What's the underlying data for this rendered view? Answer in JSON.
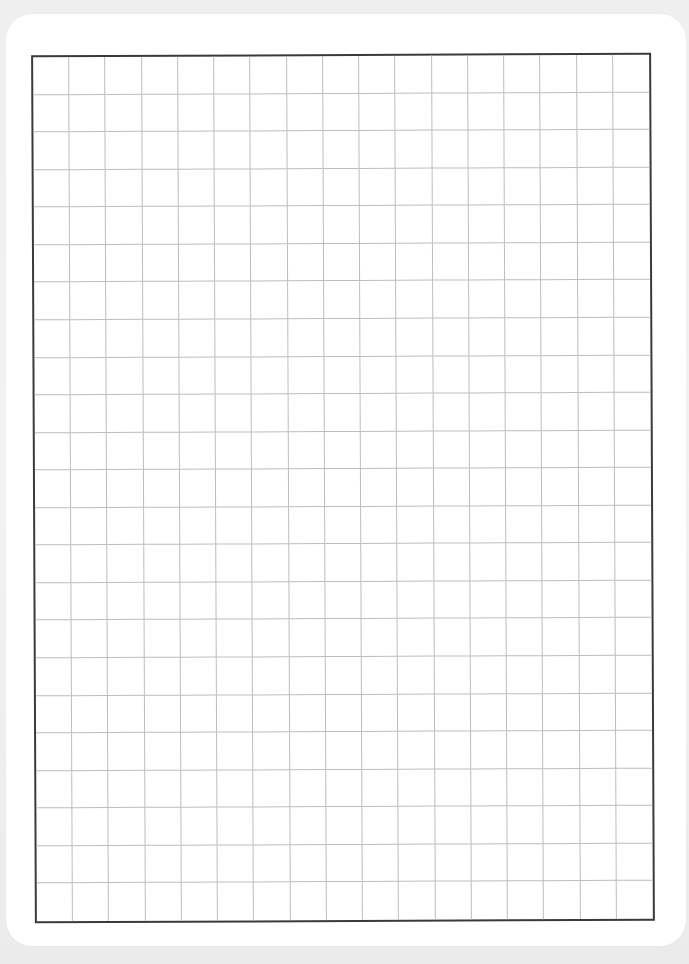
{
  "page": {
    "type": "graph-paper",
    "background_color": "#eeeeee",
    "sheet_color": "#ffffff"
  },
  "grid": {
    "columns": 17,
    "rows": 23,
    "line_color": "#bdbdbd",
    "border_color": "#3a3a3a"
  }
}
